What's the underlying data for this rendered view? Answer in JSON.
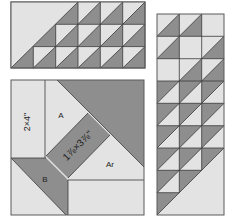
{
  "colors": {
    "light": "#e3e3e3",
    "dark": "#8e8e8e",
    "line": "#3a3a3a",
    "panel_border": "#5a5a5a"
  },
  "panels": {
    "top_strip": {
      "description": "Half-square triangle strip, 6 columns x 3 rows",
      "cols": 6,
      "rows": 3,
      "large_triangle_label": ""
    },
    "side_strip": {
      "description": "Half-square triangle strip, 3 columns x 9 rows",
      "cols": 3,
      "rows": 9
    },
    "block_detail": {
      "labels": {
        "left_strip": "2×4\"",
        "piece_a": "A",
        "center_strip": "1⅞×3⅞\"",
        "piece_ar": "Ar",
        "piece_b": "B"
      }
    }
  }
}
